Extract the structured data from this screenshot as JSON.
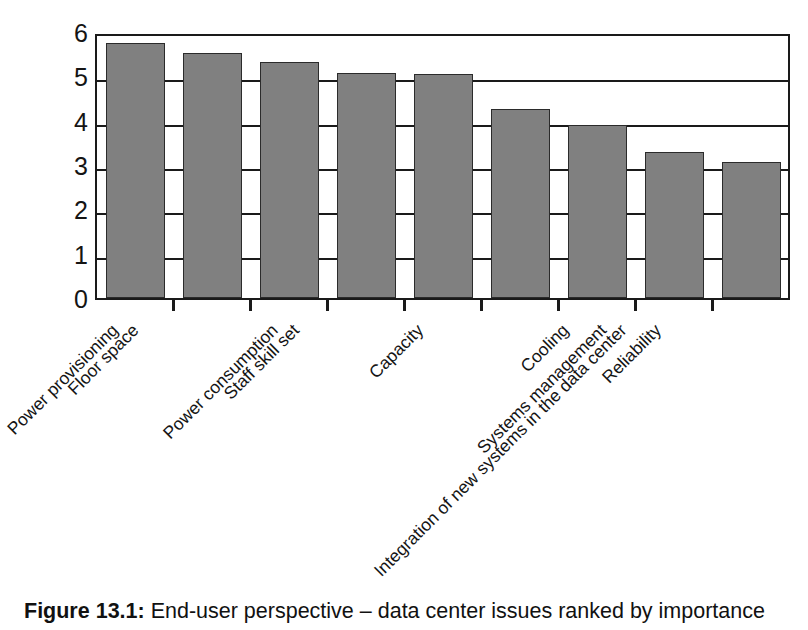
{
  "caption": {
    "label": "Figure 13.1:",
    "text": " End-user perspective – data center issues ranked by importance"
  },
  "chart_data": {
    "type": "bar",
    "title": "End-user perspective – data center issues ranked by importance",
    "xlabel": "",
    "ylabel": "",
    "ylim": [
      0,
      6
    ],
    "yticks": [
      0,
      1,
      2,
      3,
      4,
      5,
      6
    ],
    "ytick_labels": [
      "0",
      "1",
      "2",
      "3",
      "4",
      "5",
      "6"
    ],
    "grid": true,
    "legend": "none",
    "bar_color": "#808080",
    "bar_edge_color": "#2b2b2b",
    "axis_color": "#1a1a1a",
    "categories": [
      "Power provisioning",
      "Floor space",
      "Power consumption",
      "Staff skill set",
      "Integration of new systems in the data center",
      "Capacity",
      "Systems management",
      "Cooling",
      "Reliability"
    ],
    "values": [
      5.85,
      5.6,
      5.4,
      5.15,
      5.12,
      4.32,
      3.97,
      3.35,
      3.12
    ]
  }
}
